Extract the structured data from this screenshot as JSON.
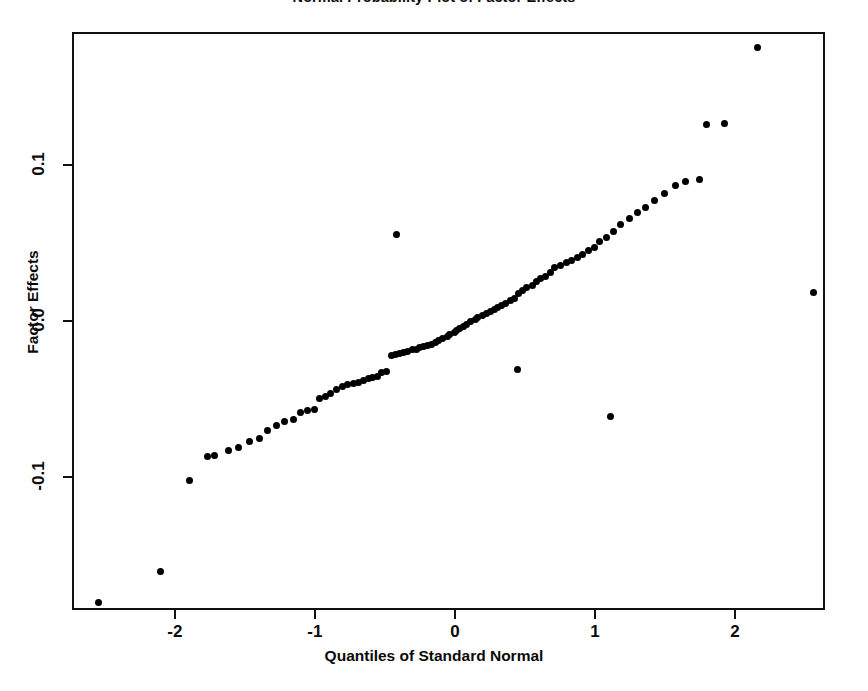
{
  "figure": {
    "background_color": "#ffffff",
    "ink_color": "#000000",
    "width": 868,
    "height": 691
  },
  "chart_data": {
    "type": "scatter",
    "title": "Normal Probability Plot of Factor Effects",
    "title_clipped": true,
    "xlabel": "Quantiles of Standard Normal",
    "ylabel": "Factor Effects",
    "xlim": [
      -2.735,
      2.643
    ],
    "ylim": [
      -0.1853,
      0.1853
    ],
    "xticks": [
      -2,
      -1,
      0,
      1,
      2
    ],
    "xticklabels": [
      "-2",
      "-1",
      "0",
      "1",
      "2"
    ],
    "yticks": [
      -0.1,
      0.0,
      0.1
    ],
    "yticklabels": [
      "-0.1",
      "0.0",
      "0.1"
    ],
    "grid": false,
    "legend": null,
    "marker": "filled-circle",
    "marker_color": "#000000",
    "marker_size_px": 7,
    "n_points": 100,
    "x": [
      -2.56,
      -2.12,
      -1.91,
      -1.78,
      -1.73,
      -1.63,
      -1.56,
      -1.48,
      -1.41,
      -1.35,
      -1.29,
      -1.23,
      -1.17,
      -1.12,
      -1.07,
      -1.02,
      -0.98,
      -0.94,
      -0.9,
      -0.86,
      -0.82,
      -0.78,
      -0.74,
      -0.7,
      -0.67,
      -0.63,
      -0.6,
      -0.57,
      -0.54,
      -0.5,
      -0.47,
      -0.44,
      -0.41,
      -0.38,
      -0.35,
      -0.32,
      -0.29,
      -0.27,
      -0.24,
      -0.21,
      -0.18,
      -0.15,
      -0.13,
      -0.1,
      -0.07,
      -0.05,
      -0.02,
      0.0,
      0.02,
      0.05,
      0.07,
      0.1,
      0.13,
      0.15,
      0.18,
      0.21,
      0.24,
      0.27,
      0.29,
      0.32,
      0.35,
      0.38,
      0.41,
      0.44,
      0.47,
      0.5,
      0.54,
      0.57,
      0.6,
      0.63,
      0.67,
      0.7,
      0.74,
      0.78,
      0.82,
      0.86,
      0.9,
      0.94,
      0.98,
      1.02,
      1.07,
      1.12,
      1.17,
      1.23,
      1.29,
      1.35,
      1.41,
      1.48,
      1.56,
      1.63,
      1.73,
      1.78,
      1.91,
      2.15,
      2.55,
      0.43,
      -0.43,
      1.1,
      -1.1,
      0.16
    ],
    "y": [
      -0.1793,
      -0.1593,
      -0.1007,
      -0.0853,
      -0.0847,
      -0.082,
      -0.08,
      -0.076,
      -0.074,
      -0.0687,
      -0.066,
      -0.0633,
      -0.062,
      -0.0573,
      -0.056,
      -0.0553,
      -0.0487,
      -0.0473,
      -0.0453,
      -0.0427,
      -0.0407,
      -0.0393,
      -0.0387,
      -0.038,
      -0.0367,
      -0.0353,
      -0.0347,
      -0.034,
      -0.032,
      -0.0313,
      -0.0207,
      -0.02,
      -0.0193,
      -0.0187,
      -0.018,
      -0.0173,
      -0.0167,
      -0.016,
      -0.0153,
      -0.0147,
      -0.014,
      -0.0127,
      -0.0113,
      -0.01,
      -0.0087,
      -0.0073,
      -0.006,
      -0.0047,
      -0.0033,
      -0.002,
      -0.0007,
      0.0007,
      0.002,
      0.0033,
      0.0047,
      0.006,
      0.0073,
      0.0087,
      0.01,
      0.0113,
      0.0127,
      0.0147,
      0.016,
      0.0187,
      0.0207,
      0.0227,
      0.024,
      0.0267,
      0.0287,
      0.03,
      0.0327,
      0.0353,
      0.0367,
      0.0387,
      0.04,
      0.042,
      0.044,
      0.0467,
      0.0487,
      0.052,
      0.0547,
      0.0587,
      0.0633,
      0.0667,
      0.0707,
      0.074,
      0.0787,
      0.0833,
      0.088,
      0.0907,
      0.092,
      0.1273,
      0.128,
      0.1767,
      0.0193,
      -0.03,
      0.0567,
      -0.06
    ]
  }
}
